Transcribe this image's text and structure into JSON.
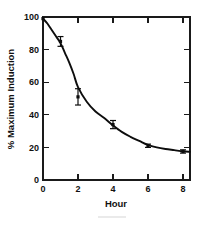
{
  "chart_data": {
    "type": "scatter",
    "title": "",
    "subtitle": "",
    "xlabel": "Hour",
    "ylabel": "% Maximum Induction",
    "xlim": [
      0,
      8.4
    ],
    "ylim": [
      0,
      100
    ],
    "xticks": [
      0,
      2,
      4,
      6,
      8
    ],
    "xticklabels": [
      "0",
      "2",
      "4",
      "6",
      "8"
    ],
    "yticks": [
      0,
      20,
      40,
      60,
      80,
      100
    ],
    "yticklabels": [
      "0",
      "20",
      "40",
      "60",
      "80",
      "100"
    ],
    "minor_xticks": [
      1,
      3,
      5,
      7
    ],
    "grid": false,
    "legend": false,
    "frame": "box-all-sides-inward-ticks",
    "marker": "filled-square",
    "series": [
      {
        "name": "% Maximum Induction",
        "x": [
          1,
          2,
          4,
          6,
          8
        ],
        "values": [
          85,
          51,
          34,
          21,
          17.5
        ],
        "yerr": [
          3,
          5,
          2.5,
          1,
          1
        ]
      }
    ],
    "fit_curve": {
      "name": "exponential decay fit",
      "x": [
        0,
        0.25,
        0.5,
        0.75,
        1,
        1.25,
        1.5,
        1.75,
        2,
        2.5,
        3,
        3.5,
        4,
        4.5,
        5,
        5.5,
        6,
        6.5,
        7,
        7.5,
        8,
        8.4
      ],
      "y": [
        99,
        96,
        92,
        88,
        84,
        78,
        72,
        65,
        57,
        48,
        42,
        38,
        33.5,
        29.5,
        26.5,
        24,
        21.5,
        20,
        19,
        18.3,
        17.6,
        17.3
      ]
    },
    "annotations": []
  },
  "axes": {
    "x_title": "Hour",
    "y_title": "% Maximum Induction"
  }
}
